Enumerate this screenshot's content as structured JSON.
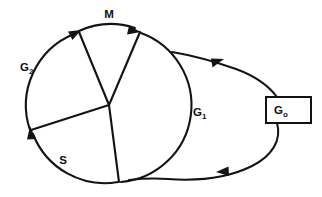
{
  "diagram": {
    "type": "cell-cycle-circular-diagram",
    "background_color": "#ffffff",
    "line_color": "#131313",
    "labels": {
      "m_phase": "M",
      "g2_phase_main": "G",
      "g2_phase_sub": "2",
      "s_phase": "S",
      "g1_phase_main": "G",
      "g1_phase_sub": "1",
      "g0_phase_main": "G",
      "g0_phase_sub": "o"
    },
    "phases": [
      {
        "id": "m",
        "label": "M",
        "position": "top",
        "start_angle_deg": -110,
        "end_angle_deg": -65,
        "label_x": 109,
        "label_y": 14
      },
      {
        "id": "g2",
        "label": "G2",
        "position": "upper-left",
        "start_angle_deg": -200,
        "end_angle_deg": -112,
        "label_x": 26,
        "label_y": 67
      },
      {
        "id": "s",
        "label": "S",
        "position": "lower-left",
        "start_angle_deg": 160,
        "end_angle_deg": 80,
        "label_x": 63,
        "label_y": 160
      },
      {
        "id": "g1",
        "label": "G1",
        "position": "right",
        "start_angle_deg": -62,
        "end_angle_deg": 78,
        "label_x": 201,
        "label_y": 114
      }
    ],
    "g0_box": {
      "label": "Go",
      "x": 266,
      "y": 97,
      "width": 45,
      "height": 26
    },
    "geometry": {
      "circle_center_x": 105,
      "circle_center_y": 106,
      "circle_radius": 77,
      "note": "restriction loop exits upper-right of circle to G0 box and returns to bottom of circle"
    },
    "arrow_count": 5,
    "direction": "clockwise"
  }
}
